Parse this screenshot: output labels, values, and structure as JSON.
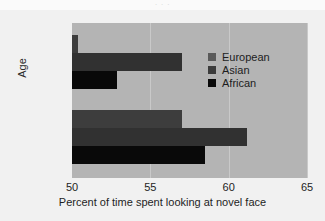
{
  "crop_strip_text": "· · ·",
  "chart_data": {
    "type": "bar",
    "orientation": "horizontal",
    "title": "",
    "xlabel": "Percent of time spent looking at novel face",
    "ylabel": "Age",
    "categories": [
      "9 months",
      "3 months"
    ],
    "xlim": [
      50,
      65
    ],
    "xticks": [
      50,
      55,
      60,
      65
    ],
    "xtick_labels": [
      "50",
      "55",
      "60",
      "65"
    ],
    "grid": true,
    "grid_axis": "x",
    "legend_position": "upper right",
    "series": [
      {
        "name": "European",
        "color": "#3d3d3d",
        "legend_color": "#5a5a5a",
        "values": [
          50.4,
          57.0
        ]
      },
      {
        "name": "Asian",
        "color": "#313131",
        "legend_color": "#3c3c3c",
        "values": [
          57.0,
          61.2
        ]
      },
      {
        "name": "African",
        "color": "#090909",
        "legend_color": "#0a0a0a",
        "values": [
          52.9,
          58.5
        ]
      }
    ],
    "plot_background": "#b4b4b4",
    "figure_background": "#f1f1f1"
  },
  "axes": {
    "x_title": "Percent of time spent looking at novel face",
    "y_title": "Age",
    "x_ticks": [
      "50",
      "55",
      "60",
      "65"
    ],
    "y_ticks": [
      "9 months",
      "3 months"
    ]
  },
  "legend": {
    "items": [
      {
        "label": "European"
      },
      {
        "label": "Asian"
      },
      {
        "label": "African"
      }
    ]
  }
}
